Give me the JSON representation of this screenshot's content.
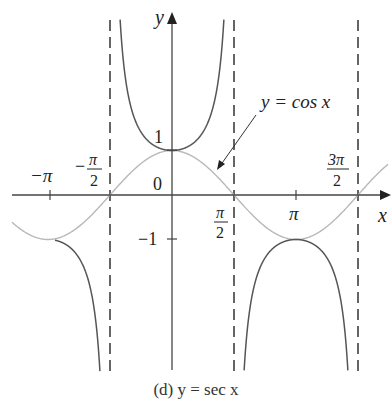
{
  "chart_data": {
    "type": "line",
    "title": "(d) y = sec x",
    "xlabel": "x",
    "ylabel": "y",
    "x_tick_labels": [
      "−π",
      "−π/2",
      "π/2",
      "π",
      "3π/2"
    ],
    "x_ticks": [
      -3.14159,
      -1.5708,
      1.5708,
      3.14159,
      4.71239
    ],
    "y_tick_labels": [
      "1",
      "−1"
    ],
    "y_ticks": [
      1,
      -1
    ],
    "origin_label": "0",
    "xlim": [
      -5.0,
      6.9
    ],
    "ylim": [
      -4.0,
      4.0
    ],
    "grid": false,
    "asymptotes": [
      -1.5708,
      1.5708,
      4.71239
    ],
    "series": [
      {
        "name": "y = sec x",
        "function": "sec(x)",
        "color": "#555555",
        "style": "solid"
      },
      {
        "name": "y = cos x",
        "function": "cos(x)",
        "color": "#b8b8b8",
        "style": "solid"
      }
    ],
    "annotations": [
      {
        "text": "y = cos x",
        "points_to": "cos x curve near x ≈ 0.9"
      }
    ]
  },
  "labels": {
    "axis_x": "x",
    "axis_y": "y",
    "origin": "0",
    "y_one": "1",
    "y_minus_one": "−1",
    "neg_pi": "−π",
    "neg_half_pi_num": "π",
    "neg_half_pi_den": "2",
    "neg_half_pi_sign": "−",
    "half_pi_num": "π",
    "half_pi_den": "2",
    "pi": "π",
    "three_half_pi_num": "3π",
    "three_half_pi_den": "2",
    "cos_label": "y = cos x",
    "caption": "(d) y = sec x"
  },
  "colors": {
    "axis": "#444444",
    "sec_curve": "#555555",
    "cos_curve": "#b8b8b8",
    "asymptote": "#333333"
  }
}
